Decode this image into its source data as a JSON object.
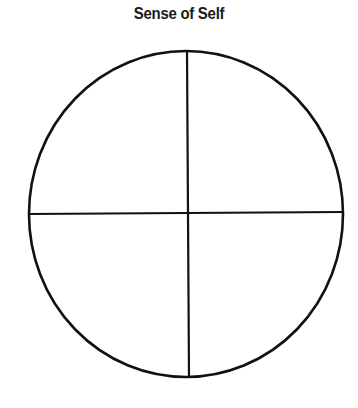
{
  "title": "Sense of Self",
  "diagram": {
    "shape": "circle divided into four quadrants",
    "quadrants": 4,
    "stroke_color": "#111111",
    "background": "#ffffff"
  }
}
